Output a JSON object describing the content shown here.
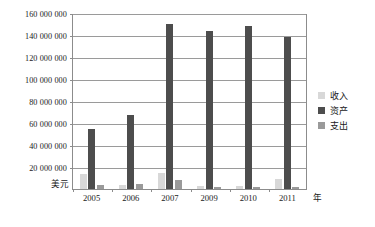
{
  "chart_data": {
    "type": "bar",
    "title": "",
    "xlabel": "年",
    "ylabel": "美元",
    "ylim": [
      0,
      160000000
    ],
    "ytick_step": 20000000,
    "grid": true,
    "legend_position": "right",
    "categories": [
      "2005",
      "2006",
      "2007",
      "2009",
      "2010",
      "2011"
    ],
    "ytick_labels": [
      "160 000 000",
      "140 000 000",
      "120 000 000",
      "100 000 000",
      "80 000 000",
      "60 000 000",
      "40 000 000",
      "20 000 000"
    ],
    "ytick_values": [
      160000000,
      140000000,
      120000000,
      100000000,
      80000000,
      60000000,
      40000000,
      20000000
    ],
    "series": [
      {
        "name": "收入",
        "color": "#d8d8d8",
        "values": [
          14000000,
          4000000,
          15000000,
          3000000,
          3000000,
          9000000
        ]
      },
      {
        "name": "资产",
        "color": "#4d4d4d",
        "values": [
          55000000,
          67000000,
          150000000,
          144000000,
          148000000,
          138000000
        ]
      },
      {
        "name": "支出",
        "color": "#9a9a9a",
        "values": [
          4000000,
          5000000,
          8000000,
          2000000,
          2000000,
          2000000
        ]
      }
    ]
  },
  "legend": {
    "items": [
      {
        "label": "收入",
        "color": "#d8d8d8"
      },
      {
        "label": "资产",
        "color": "#4d4d4d"
      },
      {
        "label": "支出",
        "color": "#9a9a9a"
      }
    ]
  },
  "axes": {
    "y_title": "美元",
    "x_title": "年"
  }
}
